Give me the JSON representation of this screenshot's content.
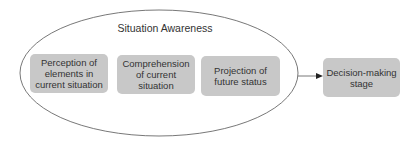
{
  "diagram": {
    "group": {
      "title": "Situation Awareness"
    },
    "nodes": [
      {
        "id": "perception",
        "label": "Perception of elements in current situation"
      },
      {
        "id": "comprehension",
        "label": "Comprehension of current situation"
      },
      {
        "id": "projection",
        "label": "Projection of future status"
      },
      {
        "id": "decision",
        "label": "Decision-making stage"
      }
    ],
    "edges": [
      {
        "from": "situation-awareness",
        "to": "decision"
      }
    ],
    "colors": {
      "box_fill": "#c8c8c8",
      "stroke": "#555555",
      "text": "#333333"
    }
  }
}
